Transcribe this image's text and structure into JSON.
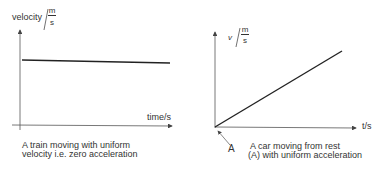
{
  "left_graph": {
    "y_label": "velocity",
    "y_unit_num": "m",
    "y_unit_den": "s",
    "x_label": "time/s",
    "caption_line1": "A train moving with uniform",
    "caption_line2": "velocity i.e. zero acceleration"
  },
  "right_graph": {
    "y_label": "v",
    "y_unit_num": "m",
    "y_unit_den": "s",
    "x_label": "t/s",
    "point_label": "A",
    "caption_line1": "A car moving from rest",
    "caption_line2": "(A) with uniform acceleration"
  },
  "colors": {
    "line": "#222222",
    "axis": "#444444"
  }
}
